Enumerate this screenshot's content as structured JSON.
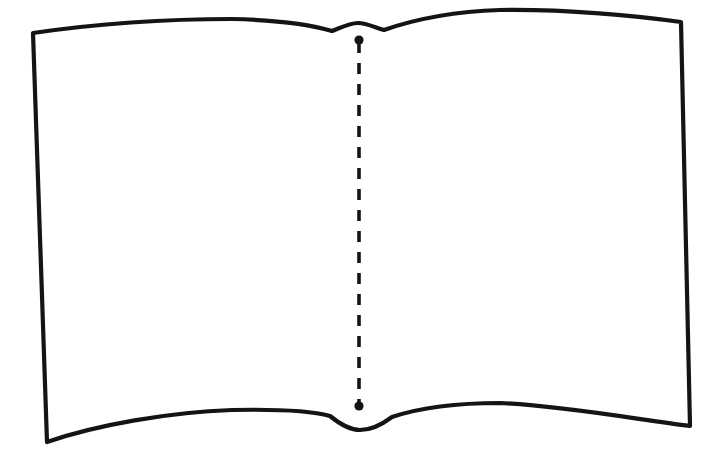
{
  "canvas": {
    "width": 723,
    "height": 465,
    "background_color": "#ffffff",
    "title": "Open Book Outline Drawing"
  },
  "drawing": {
    "name": "open-book-outline",
    "description": "Black line-art outline of an open book seen from above, with two facing blank pages and a dashed vertical centre line marking the spine fold.",
    "style": {
      "stroke_color": "#141414",
      "stroke_width": 4.2,
      "fill_color": "#ffffff",
      "line_cap": "round",
      "line_join": "round"
    },
    "elements": [
      {
        "name": "left-page",
        "label": "Left Page",
        "corner_top_outer": [
          33,
          33
        ],
        "corner_bottom_outer": [
          47,
          442
        ],
        "spine_top": [
          358,
          23
        ],
        "spine_bottom": [
          360,
          430
        ],
        "top_edge_peak_y": 19,
        "bottom_edge_peak_y": 414
      },
      {
        "name": "right-page",
        "label": "Right Page",
        "corner_top_outer": [
          681,
          22
        ],
        "corner_bottom_outer": [
          690,
          426
        ],
        "spine_top": [
          358,
          23
        ],
        "spine_bottom": [
          360,
          430
        ],
        "top_edge_peak_y": 10,
        "bottom_edge_peak_y": 403
      },
      {
        "name": "spine-fold-line",
        "label": "Spine Fold Line",
        "style": "dashed",
        "dash_length": 11,
        "gap_length": 10,
        "from": [
          359,
          42
        ],
        "to": [
          359,
          404
        ],
        "endpoint_dot_radius": 4.6,
        "endpoint_top_name": "spine-top-dot",
        "endpoint_bottom_name": "spine-bottom-dot"
      }
    ]
  },
  "geometry": {
    "outline_path": "M 33 33 C 95 24, 170 19, 232 19 C 278 20, 312 25, 332 31 C 342 27, 350 23, 358 23 C 366 23, 374 27, 384 30 C 404 23, 440 12, 500 10 C 566 9, 638 16, 681 22 L 690 426 C 640 420, 566 406, 500 403 C 443 403, 410 411, 392 417 C 380 426, 370 430, 360 430 C 350 430, 341 425, 330 416 C 312 411, 278 409, 232 410 C 170 412, 96 425, 47 442 Z",
    "fold_top_path": "M 332 31 C 342 27, 350 23, 358 23 C 366 23, 374 27, 384 30",
    "fold_bottom_path": "M 330 416 C 341 425, 350 430, 360 430 C 370 430, 380 426, 392 417",
    "center_line_x": 359,
    "center_line_top_y": 42,
    "center_line_bottom_y": 404
  }
}
